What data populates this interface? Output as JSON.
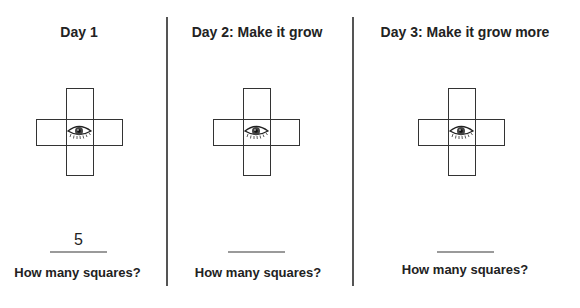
{
  "panels": [
    {
      "title": "Day 1",
      "answer": "5",
      "question": "How many squares?",
      "figure": "plus-cross-5-squares",
      "icon": "eye-icon"
    },
    {
      "title": "Day 2: Make it grow",
      "answer": "",
      "question": "How many squares?",
      "figure": "plus-cross-5-squares",
      "icon": "eye-icon"
    },
    {
      "title": "Day 3: Make it grow more",
      "answer": "",
      "question": "How many squares?",
      "figure": "plus-cross-5-squares",
      "icon": "eye-icon"
    }
  ],
  "colors": {
    "text": "#222222",
    "divider": "#555555",
    "answer_line": "#9a9a9a",
    "square_stroke": "#333333"
  }
}
